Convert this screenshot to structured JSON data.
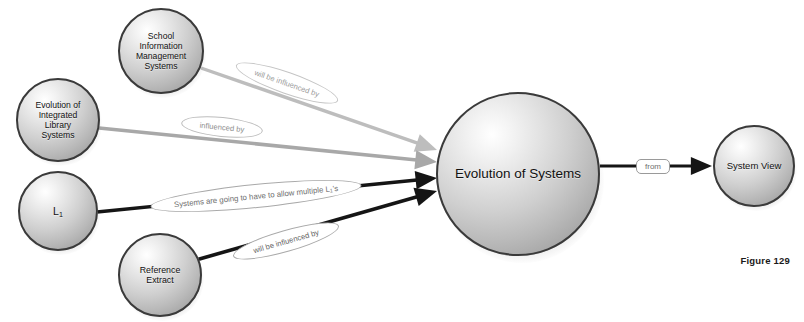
{
  "figure": {
    "caption": "Figure 129",
    "background_color": "#ffffff"
  },
  "diagram": {
    "type": "concept-map",
    "node_fill_light": "#f2f2f2",
    "node_fill_dark": "#8d8d8d",
    "node_stroke": "#3a3a3a",
    "edge_color_light": "#b8b8b8",
    "edge_color_dark": "#1a1a1a",
    "nodes": [
      {
        "id": "school-information-management-systems",
        "label": "School\nInformation\nManagement\nSystems",
        "cx": 161,
        "cy": 51,
        "r": 43,
        "font_size": 8.6
      },
      {
        "id": "evolution-of-integrated-library-systems",
        "label": "Evolution of\nIntegrated\nLibrary\nSystems",
        "cx": 58,
        "cy": 120,
        "r": 42,
        "font_size": 8.6
      },
      {
        "id": "l1",
        "label": "L1",
        "label_html": "L<sub>1</sub>",
        "cx": 58,
        "cy": 211,
        "r": 40,
        "font_size": 10.5
      },
      {
        "id": "reference-extract",
        "label": "Reference\nExtract",
        "cx": 160,
        "cy": 275,
        "r": 42,
        "font_size": 8.8
      },
      {
        "id": "evolution-of-systems",
        "label": "Evolution of Systems",
        "cx": 518,
        "cy": 174,
        "r": 82,
        "font_size": 13.5
      },
      {
        "id": "system-view",
        "label": "System View",
        "cx": 754,
        "cy": 166,
        "r": 41,
        "font_size": 9.5
      }
    ],
    "edges": [
      {
        "id": "sims-to-evolution",
        "from": "school-information-management-systems",
        "to": "evolution-of-systems",
        "label": "will be influenced by",
        "color": "#bdbdbd",
        "text_color": "#9a9a9a",
        "border_color": "#c4c4c4",
        "width": 3.4,
        "x1": 201,
        "y1": 68,
        "x2": 437,
        "y2": 150,
        "label_cx": 287,
        "label_cy": 83,
        "label_w": 108,
        "label_h": 22,
        "label_font": 7.6,
        "label_shape": "ellipse",
        "arrow": true
      },
      {
        "id": "eils-to-evolution",
        "from": "evolution-of-integrated-library-systems",
        "to": "evolution-of-systems",
        "label": "influenced by",
        "color": "#a8a8a8",
        "text_color": "#8f8f8f",
        "border_color": "#bcbcbc",
        "width": 3.6,
        "x1": 99,
        "y1": 128,
        "x2": 437,
        "y2": 162,
        "label_cx": 222,
        "label_cy": 127,
        "label_w": 82,
        "label_h": 20,
        "label_font": 7.6,
        "label_shape": "ellipse",
        "arrow": true
      },
      {
        "id": "l1-to-evolution",
        "from": "l1",
        "to": "evolution-of-systems",
        "label": "Systems are going to have to allow multiple L1's",
        "label_html": "Systems are going to have to allow multiple L<sub>1</sub>'s",
        "color": "#151515",
        "text_color": "#6f6f6f",
        "border_color": "#a9a9a9",
        "width": 3.4,
        "x1": 97,
        "y1": 212,
        "x2": 437,
        "y2": 178,
        "label_cx": 256,
        "label_cy": 196,
        "label_w": 212,
        "label_h": 24,
        "label_font": 7.8,
        "label_shape": "ellipse",
        "arrow": true
      },
      {
        "id": "reference-extract-to-evolution",
        "from": "reference-extract",
        "to": "evolution-of-systems",
        "label": "will be influenced by",
        "color": "#151515",
        "text_color": "#5f5f5f",
        "border_color": "#a9a9a9",
        "width": 3.6,
        "x1": 196,
        "y1": 260,
        "x2": 437,
        "y2": 191,
        "label_cx": 286,
        "label_cy": 241,
        "label_w": 110,
        "label_h": 22,
        "label_font": 7.6,
        "label_shape": "ellipse",
        "arrow": true
      },
      {
        "id": "evolution-to-system-view",
        "from": "evolution-of-systems",
        "to": "system-view",
        "label": "from",
        "color": "#151515",
        "text_color": "#707070",
        "border_color": "#9a9a9a",
        "width": 3.2,
        "x1": 600,
        "y1": 166,
        "x2": 712,
        "y2": 166,
        "label_cx": 653,
        "label_cy": 166,
        "label_w": 34,
        "label_h": 15,
        "label_font": 8,
        "label_shape": "pill",
        "arrow": true
      }
    ]
  }
}
